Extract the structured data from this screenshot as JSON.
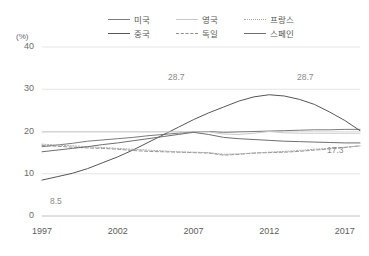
{
  "axis_unit": "(%)",
  "legend": {
    "items": [
      {
        "label": "미국",
        "color": "#7b7b7b",
        "dash": "none"
      },
      {
        "label": "영국",
        "color": "#c9c9c9",
        "dash": "none"
      },
      {
        "label": "프랑스",
        "color": "#a8a8a8",
        "dash": "dotted"
      },
      {
        "label": "중국",
        "color": "#565656",
        "dash": "none"
      },
      {
        "label": "독일",
        "color": "#8f8f8f",
        "dash": "dashed"
      },
      {
        "label": "스페인",
        "color": "#6f6f6f",
        "dash": "none"
      }
    ]
  },
  "annotations": [
    {
      "text": "28.7",
      "x": 168,
      "y": 72
    },
    {
      "text": "28.7",
      "x": 297,
      "y": 72
    },
    {
      "text": "17.3",
      "x": 327,
      "y": 145
    },
    {
      "text": "8.5",
      "x": 50,
      "y": 196
    }
  ],
  "chart_data": {
    "type": "line",
    "title": "",
    "xlabel": "",
    "ylabel": "(%)",
    "ylim": [
      0,
      40
    ],
    "xlim": [
      1997,
      2018
    ],
    "yticks": [
      0,
      10,
      20,
      30,
      40
    ],
    "xticks": [
      1997,
      2002,
      2007,
      2012,
      2017
    ],
    "grid": true,
    "legend_position": "top-center",
    "x": [
      1997,
      1998,
      1999,
      2000,
      2001,
      2002,
      2003,
      2004,
      2005,
      2006,
      2007,
      2008,
      2009,
      2010,
      2011,
      2012,
      2013,
      2014,
      2015,
      2016,
      2017,
      2018
    ],
    "series": [
      {
        "name": "미국",
        "color": "#7b7b7b",
        "dash": "none",
        "values": [
          16.4,
          16.8,
          17.2,
          17.7,
          18.0,
          18.3,
          18.6,
          19.0,
          19.3,
          19.6,
          19.9,
          20.0,
          19.8,
          19.9,
          20.0,
          20.1,
          20.2,
          20.3,
          20.4,
          20.4,
          20.5,
          20.5
        ]
      },
      {
        "name": "중국",
        "color": "#565656",
        "dash": "none",
        "values": [
          8.5,
          9.3,
          10.1,
          11.2,
          12.6,
          14.0,
          15.6,
          17.4,
          19.2,
          21.0,
          22.8,
          24.4,
          25.8,
          27.2,
          28.2,
          28.7,
          28.4,
          27.6,
          26.4,
          24.6,
          22.6,
          20.2
        ]
      },
      {
        "name": "영국",
        "color": "#c9c9c9",
        "dash": "none",
        "values": [
          19.9,
          19.9,
          19.9,
          19.9,
          19.9,
          19.9,
          19.9,
          19.9,
          19.9,
          19.9,
          19.9,
          19.9,
          19.4,
          19.3,
          19.6,
          20.0,
          19.7,
          19.6,
          19.6,
          19.6,
          19.6,
          19.6
        ]
      },
      {
        "name": "독일",
        "color": "#8f8f8f",
        "dash": "dashed",
        "values": [
          16.7,
          16.5,
          16.3,
          16.1,
          16.0,
          15.8,
          15.5,
          15.3,
          15.2,
          15.1,
          15.0,
          14.9,
          14.4,
          14.6,
          14.9,
          15.0,
          15.1,
          15.3,
          15.6,
          15.9,
          16.2,
          16.6
        ]
      },
      {
        "name": "프랑스",
        "color": "#a8a8a8",
        "dash": "dotted",
        "values": [
          17.0,
          16.8,
          16.6,
          16.4,
          16.2,
          16.0,
          15.8,
          15.6,
          15.4,
          15.2,
          15.1,
          15.0,
          14.6,
          14.7,
          14.9,
          15.1,
          15.3,
          15.5,
          15.8,
          16.0,
          16.3,
          16.6
        ]
      },
      {
        "name": "스페인",
        "color": "#6f6f6f",
        "dash": "none",
        "values": [
          15.2,
          15.6,
          16.0,
          16.4,
          16.9,
          17.3,
          17.8,
          18.3,
          18.8,
          19.3,
          19.8,
          19.3,
          18.6,
          18.3,
          18.1,
          17.9,
          17.7,
          17.6,
          17.5,
          17.4,
          17.3,
          17.3
        ]
      }
    ]
  }
}
